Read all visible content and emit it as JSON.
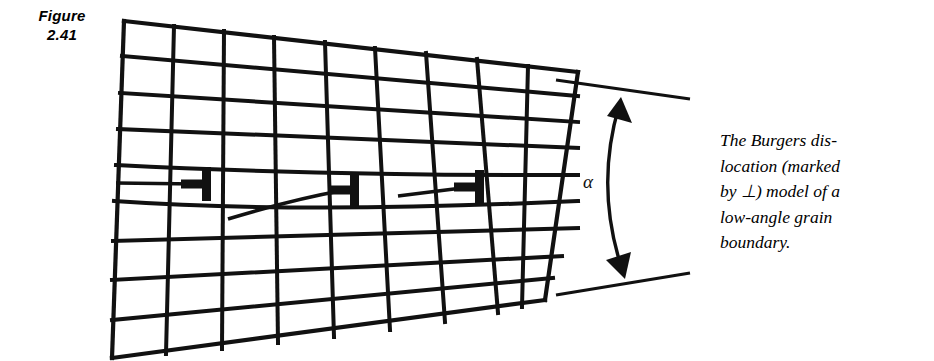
{
  "figure": {
    "label_line1": "Figure",
    "label_line2": "2.41",
    "label_text": "Figure\n2.41",
    "caption_text": "The Burgers dis-\nlocation (marked\nby ⊥) model of a\nlow-angle grain\nboundary.",
    "caption_lines": [
      "The Burgers dis-",
      "location (marked",
      "by ⊥) model of a",
      "low-angle grain",
      "boundary."
    ],
    "angle_label": "α",
    "dislocation_symbol": "⊣",
    "dislocation_count": 3,
    "ink_color": "#111111",
    "background_color": "#ffffff"
  },
  "diagram_data": {
    "type": "diagram",
    "subject": "low-angle grain boundary modeled by an array of edge dislocations in a distorted crystal lattice",
    "grid": {
      "columns": 9,
      "rows": 9,
      "description": "quadrilateral lattice drawn in perspective; left edge near-vertical, top edge slopes down to the right, rows converge toward the dislocation cores"
    },
    "annotations": [
      {
        "name": "angle-alpha",
        "label": "α",
        "meaning": "misorientation angle between the two grains"
      },
      {
        "name": "dislocation-1",
        "label": "⊣"
      },
      {
        "name": "dislocation-2",
        "label": "⊣"
      },
      {
        "name": "dislocation-3",
        "label": "⊣"
      }
    ]
  }
}
